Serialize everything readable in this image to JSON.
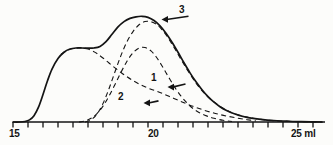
{
  "figure": {
    "background_color": "#fcfcfa",
    "line_color": "#141414"
  },
  "axis": {
    "label_15": "15",
    "label_20": "20",
    "label_25": "25 ml"
  },
  "annotations": {
    "peak1": "1",
    "peak2": "2",
    "peak3": "3"
  },
  "chart_data": {
    "type": "line",
    "title": "",
    "xlabel": "ml",
    "ylabel": "",
    "xlim": [
      15,
      25.4
    ],
    "ylim": [
      0,
      1.05
    ],
    "grid": false,
    "legend": "none",
    "axis_ticks": [
      15,
      15.5,
      16,
      16.5,
      17,
      17.5,
      18,
      18.5,
      19,
      19.5,
      20,
      20.5,
      21,
      21.5,
      22,
      22.5,
      23,
      23.5,
      24,
      24.5,
      25
    ],
    "tick_labels": {
      "15": "15",
      "20": "20",
      "25": "25 ml"
    },
    "annotations": [
      {
        "text": "1",
        "points_to_x": 20.15,
        "points_to_y": 0.33,
        "label_x": 20.75,
        "label_y": 0.36
      },
      {
        "text": "2",
        "points_to_x": 19.35,
        "points_to_y": 0.18,
        "label_x": 19.85,
        "label_y": 0.2
      },
      {
        "text": "3",
        "points_to_x": 19.95,
        "points_to_y": 0.97,
        "label_x": 20.85,
        "label_y": 1.0
      }
    ],
    "series": [
      {
        "name": "total",
        "style": "solid",
        "x": [
          15.0,
          15.2,
          15.4,
          15.55,
          15.7,
          15.85,
          16.0,
          16.15,
          16.3,
          16.5,
          16.7,
          16.9,
          17.1,
          17.3,
          17.5,
          17.7,
          17.9,
          18.1,
          18.3,
          18.5,
          18.7,
          18.9,
          19.1,
          19.3,
          19.5,
          19.7,
          19.9,
          20.1,
          20.3,
          20.5,
          20.7,
          20.9,
          21.1,
          21.3,
          21.5,
          21.7,
          21.9,
          22.1,
          22.4,
          22.7,
          23.0,
          23.4,
          23.8,
          24.2,
          24.6,
          25.0,
          25.3
        ],
        "y": [
          0.0,
          0.0,
          0.005,
          0.02,
          0.06,
          0.14,
          0.26,
          0.39,
          0.5,
          0.6,
          0.66,
          0.69,
          0.7,
          0.7,
          0.698,
          0.7,
          0.715,
          0.76,
          0.83,
          0.9,
          0.95,
          0.98,
          0.995,
          1.0,
          0.99,
          0.96,
          0.91,
          0.84,
          0.755,
          0.66,
          0.56,
          0.465,
          0.38,
          0.305,
          0.24,
          0.188,
          0.145,
          0.112,
          0.075,
          0.05,
          0.034,
          0.02,
          0.012,
          0.007,
          0.003,
          0.001,
          0.0
        ]
      },
      {
        "name": "component-1",
        "style": "dashed",
        "x": [
          16.6,
          16.8,
          17.0,
          17.2,
          17.35,
          17.5,
          17.65,
          17.8,
          18.0,
          18.2,
          18.4,
          18.6,
          18.8,
          19.0,
          19.2,
          19.4,
          19.6,
          19.8,
          20.0,
          20.2,
          20.45,
          20.7,
          21.0,
          21.3,
          21.6,
          21.9,
          22.2,
          22.5,
          22.8,
          23.1
        ],
        "y": [
          0.64,
          0.675,
          0.695,
          0.7,
          0.698,
          0.69,
          0.672,
          0.648,
          0.605,
          0.558,
          0.512,
          0.468,
          0.428,
          0.392,
          0.36,
          0.333,
          0.31,
          0.29,
          0.268,
          0.243,
          0.212,
          0.182,
          0.148,
          0.118,
          0.092,
          0.07,
          0.052,
          0.036,
          0.022,
          0.01
        ]
      },
      {
        "name": "component-2",
        "style": "dashed",
        "x": [
          17.2,
          17.4,
          17.6,
          17.8,
          18.0,
          18.2,
          18.4,
          18.6,
          18.8,
          19.0,
          19.2,
          19.4,
          19.6,
          19.8,
          20.0,
          20.2,
          20.4,
          20.6,
          20.8,
          21.0,
          21.2,
          21.45,
          21.7,
          22.0,
          22.3
        ],
        "y": [
          0.0,
          0.01,
          0.035,
          0.08,
          0.15,
          0.245,
          0.355,
          0.47,
          0.575,
          0.655,
          0.7,
          0.705,
          0.672,
          0.605,
          0.515,
          0.418,
          0.325,
          0.245,
          0.18,
          0.128,
          0.09,
          0.058,
          0.035,
          0.016,
          0.005
        ]
      },
      {
        "name": "component-3",
        "style": "dashed",
        "x": [
          17.4,
          17.6,
          17.8,
          18.0,
          18.2,
          18.4,
          18.6,
          18.8,
          19.0,
          19.2,
          19.4,
          19.6,
          19.8,
          20.0,
          20.2,
          20.4,
          20.6,
          20.8,
          21.0,
          21.2,
          21.45,
          21.7,
          22.0,
          22.3,
          22.6,
          23.0,
          23.4,
          23.8,
          24.2,
          24.6,
          25.0,
          25.3
        ],
        "y": [
          0.0,
          0.02,
          0.075,
          0.175,
          0.315,
          0.475,
          0.63,
          0.76,
          0.855,
          0.92,
          0.95,
          0.948,
          0.92,
          0.862,
          0.782,
          0.69,
          0.592,
          0.498,
          0.41,
          0.33,
          0.25,
          0.19,
          0.13,
          0.088,
          0.06,
          0.035,
          0.02,
          0.011,
          0.006,
          0.003,
          0.001,
          0.0
        ]
      }
    ]
  }
}
